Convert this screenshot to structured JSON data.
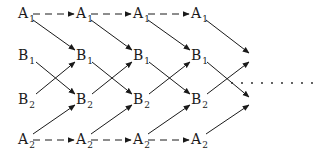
{
  "diagram": {
    "type": "lattice-flow",
    "rows": [
      {
        "id": "A1",
        "letter": "A",
        "subscript": "1"
      },
      {
        "id": "B1",
        "letter": "B",
        "subscript": "1"
      },
      {
        "id": "B2",
        "letter": "B",
        "subscript": "2"
      },
      {
        "id": "A2",
        "letter": "A",
        "subscript": "2"
      }
    ],
    "columns": 4,
    "nodes": [
      {
        "letter": "A",
        "sub": "1"
      },
      {
        "letter": "A",
        "sub": "1"
      },
      {
        "letter": "A",
        "sub": "1"
      },
      {
        "letter": "A",
        "sub": "1"
      },
      {
        "letter": "B",
        "sub": "1"
      },
      {
        "letter": "B",
        "sub": "1"
      },
      {
        "letter": "B",
        "sub": "1"
      },
      {
        "letter": "B",
        "sub": "1"
      },
      {
        "letter": "B",
        "sub": "2"
      },
      {
        "letter": "B",
        "sub": "2"
      },
      {
        "letter": "B",
        "sub": "2"
      },
      {
        "letter": "B",
        "sub": "2"
      },
      {
        "letter": "A",
        "sub": "2"
      },
      {
        "letter": "A",
        "sub": "2"
      },
      {
        "letter": "A",
        "sub": "2"
      },
      {
        "letter": "A",
        "sub": "2"
      }
    ],
    "edges": {
      "dashed_horizontal": "A rows connect left-to-right with dashed arrows",
      "solid_diagonal": "A1 → B1 next column; B1 → B2 next column; B2 → B1 next column; A2 → B2 next column",
      "continuation": "dotted line extends to the right after final column"
    },
    "colors": {
      "ink": "#1a1a1a",
      "background": "#ffffff"
    }
  }
}
